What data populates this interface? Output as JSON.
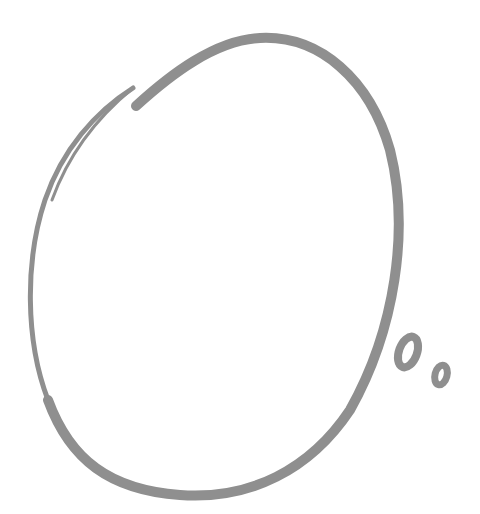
{
  "illustration": {
    "subject": "thought-bubble",
    "stroke_color": "#8f8f8f",
    "background": "#ffffff"
  }
}
